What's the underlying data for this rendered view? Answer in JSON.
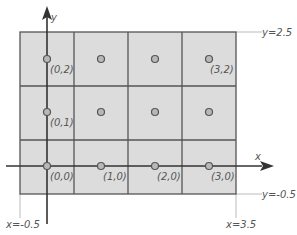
{
  "diagram": {
    "colors": {
      "cell_fill": "#dcdcdc",
      "grid_line": "#555555",
      "axis": "#333333",
      "guide": "#bbbbbb",
      "dot_fill": "#b8b8b8",
      "dot_stroke": "#555555",
      "text": "#555555"
    },
    "axes": {
      "x_label": "x",
      "y_label": "y"
    },
    "bounds": {
      "top": "y=2.5",
      "bottom": "y=-0.5",
      "left": "x=-0.5",
      "right": "x=3.5"
    },
    "grid": {
      "columns": 4,
      "rows": 3
    },
    "points": [
      {
        "x": 0,
        "y": 2,
        "label": "(0,2)"
      },
      {
        "x": 1,
        "y": 2,
        "label": ""
      },
      {
        "x": 2,
        "y": 2,
        "label": ""
      },
      {
        "x": 3,
        "y": 2,
        "label": "(3,2)"
      },
      {
        "x": 0,
        "y": 1,
        "label": "(0,1)"
      },
      {
        "x": 1,
        "y": 1,
        "label": ""
      },
      {
        "x": 2,
        "y": 1,
        "label": ""
      },
      {
        "x": 3,
        "y": 1,
        "label": ""
      },
      {
        "x": 0,
        "y": 0,
        "label": "(0,0)"
      },
      {
        "x": 1,
        "y": 0,
        "label": "(1,0)"
      },
      {
        "x": 2,
        "y": 0,
        "label": "(2,0)"
      },
      {
        "x": 3,
        "y": 0,
        "label": "(3,0)"
      }
    ]
  }
}
